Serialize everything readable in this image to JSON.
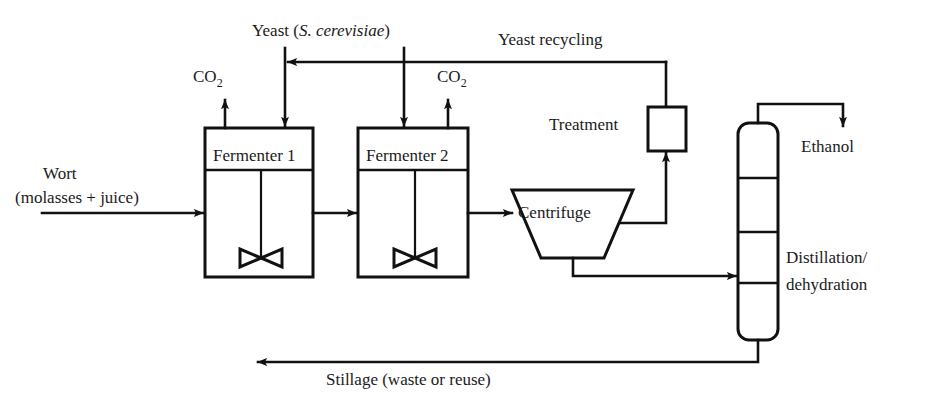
{
  "diagram": {
    "background_color": "#ffffff",
    "line_color": "#111111",
    "text_color": "#1a1a1a"
  },
  "units": {
    "fermenter1": "Fermenter 1",
    "fermenter2": "Fermenter 2",
    "centrifuge": "Centrifuge",
    "treatment": "Treatment",
    "column_line1": "Distillation/",
    "column_line2": "dehydration"
  },
  "streams": {
    "feed_line1": "Wort",
    "feed_line2": "(molasses + juice)",
    "yeast_label_prefix": "Yeast (",
    "yeast_label_italic": "S. cerevisiae",
    "yeast_label_suffix": ")",
    "co2_first": "CO",
    "co2_first_sub": "2",
    "co2_second": "CO",
    "co2_second_sub": "2",
    "yeast_recycling": "Yeast recycling",
    "ethanol": "Ethanol",
    "stillage": "Stillage (waste or reuse)"
  },
  "icons": {
    "impeller": "impeller-icon",
    "arrowhead": "arrowhead-icon"
  }
}
